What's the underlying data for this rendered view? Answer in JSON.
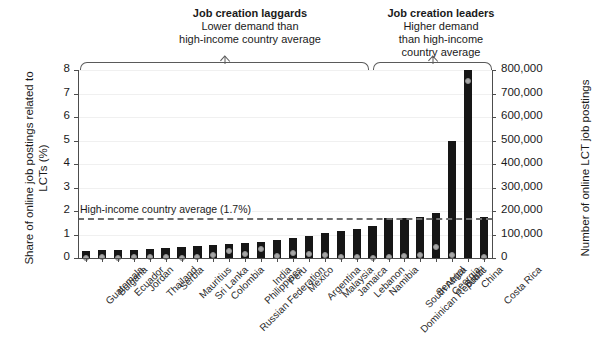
{
  "chart_data": {
    "type": "bar",
    "title": "",
    "xlabel": "",
    "ylabel": "Share of online job postings related to LCTs (%)",
    "ylabel_right": "Number of online LCT job postings",
    "ylim": [
      0,
      8
    ],
    "yticks": [
      "0",
      "1",
      "2",
      "3",
      "4",
      "5",
      "6",
      "7",
      "8"
    ],
    "ylim_right": [
      0,
      800000
    ],
    "yticks_right": [
      "0",
      "100,000",
      "200,000",
      "300,000",
      "400,000",
      "500,000",
      "600,000",
      "700,000",
      "800,000"
    ],
    "grid": true,
    "legend_position": "none",
    "categories": [
      "Guatemala",
      "Bulgaria",
      "Ecuador",
      "Jordan",
      "Thailand",
      "Serbia",
      "Mauritius",
      "Sri Lanka",
      "Colombia",
      "Russian Federation",
      "Philippines",
      "India",
      "Peru",
      "Mexico",
      "Argentina",
      "Malaysia",
      "Jamaica",
      "Lebanon",
      "Namibia",
      "Dominican Republic",
      "South Africa",
      "Senegal",
      "Georgia",
      "Brazil",
      "China",
      "Costa Rica"
    ],
    "series": [
      {
        "name": "Share of online job postings related to LCTs (%)",
        "axis": "left",
        "type": "bar",
        "color": "#161616",
        "values": [
          0.3,
          0.32,
          0.34,
          0.36,
          0.38,
          0.42,
          0.46,
          0.5,
          0.55,
          0.58,
          0.62,
          0.66,
          0.78,
          0.85,
          0.95,
          1.05,
          1.15,
          1.25,
          1.35,
          1.7,
          1.72,
          1.73,
          1.9,
          5.0,
          8.0,
          1.73
        ]
      },
      {
        "name": "Number of online LCT job postings",
        "axis": "right",
        "type": "scatter",
        "color": "#a8a8a8",
        "values": [
          2000,
          2500,
          2000,
          2500,
          3000,
          4000,
          1500,
          5000,
          12000,
          30000,
          18000,
          40000,
          8000,
          22000,
          15000,
          12000,
          3000,
          4000,
          2000,
          6000,
          9000,
          11000,
          45000,
          12000,
          755000,
          3000
        ]
      }
    ],
    "reference_line": {
      "label": "High-income country average (1.7%)",
      "value": 1.7
    },
    "annotations": [
      {
        "header": "Job creation laggards",
        "subtitle_lines": [
          "Lower demand than",
          "high-income country average"
        ],
        "span_from": "Guatemala",
        "span_to": "Lebanon"
      },
      {
        "header": "Job creation leaders",
        "subtitle_lines": [
          "Higher demand",
          "than high-income",
          "country average"
        ],
        "span_from": "Namibia",
        "span_to": "Costa Rica"
      }
    ]
  }
}
